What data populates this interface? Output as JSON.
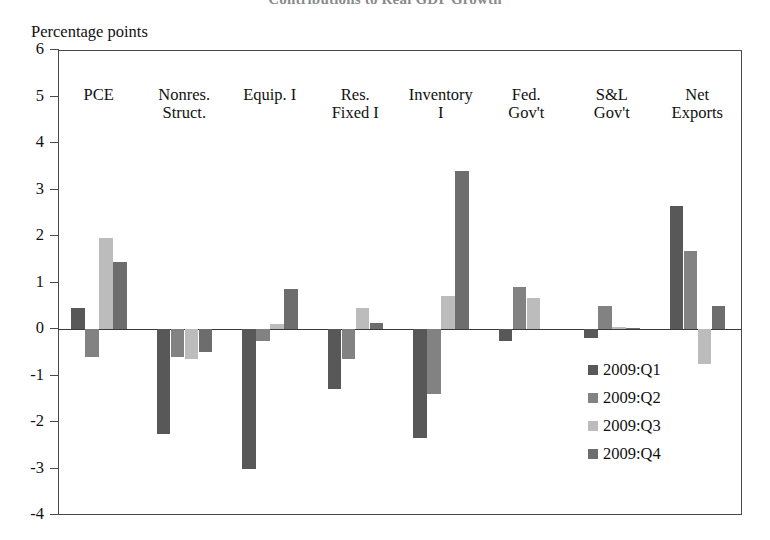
{
  "figure": {
    "title_partial": "Contributions to Real GDP Growth",
    "y_axis_unit": "Percentage points"
  },
  "chart_data": {
    "type": "bar",
    "title": "Contributions to Real GDP Growth",
    "subtitle": "",
    "xlabel": "",
    "ylabel": "Percentage points",
    "ylim": [
      -4,
      6
    ],
    "ytick_labels": [
      "6",
      "5",
      "4",
      "3",
      "2",
      "1",
      "0",
      "-1",
      "-2",
      "-3",
      "-4"
    ],
    "yticks": [
      6,
      5,
      4,
      3,
      2,
      1,
      0,
      -1,
      -2,
      -3,
      -4
    ],
    "grid": false,
    "legend_position": "inside lower-right",
    "orientation": "vertical-grouped",
    "categories": [
      "PCE",
      "Nonres. Struct.",
      "Equip. I",
      "Res. Fixed I",
      "Inventory I",
      "Fed. Gov't",
      "S&L Gov't",
      "Net Exports"
    ],
    "category_lines": [
      [
        "PCE",
        ""
      ],
      [
        "Nonres.",
        "Struct."
      ],
      [
        "Equip. I",
        ""
      ],
      [
        "Res.",
        "Fixed I"
      ],
      [
        "Inventory",
        "I"
      ],
      [
        "Fed.",
        "Gov't"
      ],
      [
        "S&L",
        "Gov't"
      ],
      [
        "Net",
        "Exports"
      ]
    ],
    "series": [
      {
        "name": "2009:Q1",
        "color": "#585858",
        "values": [
          0.45,
          -2.25,
          -3.0,
          -1.3,
          -2.35,
          -0.25,
          -0.2,
          2.65
        ]
      },
      {
        "name": "2009:Q2",
        "color": "#828282",
        "values": [
          -0.6,
          -0.6,
          -0.25,
          -0.65,
          -1.4,
          0.9,
          0.5,
          1.67
        ]
      },
      {
        "name": "2009:Q3",
        "color": "#bcbcbc",
        "values": [
          1.95,
          -0.65,
          0.1,
          0.45,
          0.72,
          0.67,
          0.05,
          -0.75
        ]
      },
      {
        "name": "2009:Q4",
        "color": "#6d6d6d",
        "values": [
          1.45,
          -0.5,
          0.85,
          0.12,
          3.4,
          0.0,
          0.02,
          0.5
        ]
      }
    ]
  },
  "legend": {
    "items": [
      {
        "label": "2009:Q1",
        "color": "#585858"
      },
      {
        "label": "2009:Q2",
        "color": "#828282"
      },
      {
        "label": "2009:Q3",
        "color": "#bcbcbc"
      },
      {
        "label": "2009:Q4",
        "color": "#6d6d6d"
      }
    ]
  }
}
